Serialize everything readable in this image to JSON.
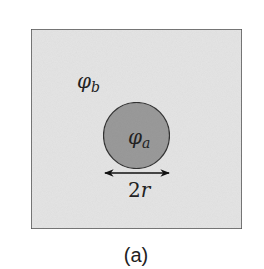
{
  "figure": {
    "caption": "(a)",
    "outer_region": {
      "symbol": "φ",
      "subscript": "b",
      "fill": "#e4e4e4",
      "stroke": "#5a5a5a"
    },
    "inclusion": {
      "symbol": "φ",
      "subscript": "a",
      "fill": "#9a9a9a",
      "stroke": "#333333"
    },
    "dimension": {
      "label_main": "2",
      "label_var": "r"
    }
  }
}
